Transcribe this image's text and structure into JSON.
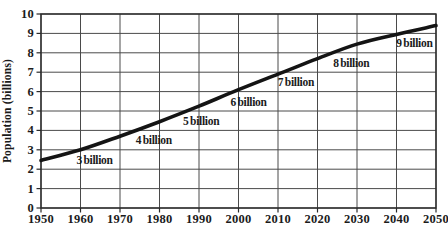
{
  "chart_data": {
    "type": "line",
    "title": "",
    "ylabel": "Population (billions)",
    "xlabel": "",
    "xlim": [
      1950,
      2050
    ],
    "ylim": [
      0,
      10
    ],
    "x_ticks": [
      1950,
      1960,
      1970,
      1980,
      1990,
      2000,
      2010,
      2020,
      2030,
      2040,
      2050
    ],
    "y_ticks": [
      0,
      1,
      2,
      3,
      4,
      5,
      6,
      7,
      8,
      9,
      10
    ],
    "grid": true,
    "legend": "none",
    "series": [
      {
        "name": "world-population",
        "x": [
          1950,
          1960,
          1970,
          1980,
          1990,
          2000,
          2010,
          2020,
          2030,
          2040,
          2050
        ],
        "values": [
          2.45,
          3.0,
          3.7,
          4.45,
          5.25,
          6.1,
          6.9,
          7.7,
          8.45,
          8.95,
          9.4
        ]
      }
    ],
    "annotations": [
      {
        "label": "3 billion",
        "year": 1960,
        "value": 3
      },
      {
        "label": "4 billion",
        "year": 1975,
        "value": 4
      },
      {
        "label": "5 billion",
        "year": 1987,
        "value": 5
      },
      {
        "label": "6 billion",
        "year": 1999,
        "value": 6
      },
      {
        "label": "7 billion",
        "year": 2011,
        "value": 7
      },
      {
        "label": "8 billion",
        "year": 2025,
        "value": 8
      },
      {
        "label": "9 billion",
        "year": 2041,
        "value": 9
      }
    ],
    "colors": {
      "line": "#141414",
      "grid": "#4a4a4a",
      "axis": "#2a2a2a",
      "text": "#1b1b1b",
      "background": "#ffffff"
    }
  }
}
